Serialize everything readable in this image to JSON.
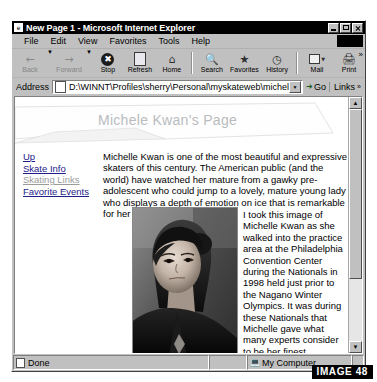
{
  "window": {
    "title": "New Page 1 - Microsoft Internet Explorer",
    "icon": "ie-document-icon",
    "controls": {
      "minimize": "Minimize",
      "maximize": "Maximize",
      "close": "Close"
    }
  },
  "menu": {
    "items": [
      {
        "label": "File"
      },
      {
        "label": "Edit"
      },
      {
        "label": "View"
      },
      {
        "label": "Favorites"
      },
      {
        "label": "Tools"
      },
      {
        "label": "Help"
      }
    ]
  },
  "toolbar": {
    "buttons": [
      {
        "label": "Back",
        "icon": "arrow-left-icon",
        "enabled": false
      },
      {
        "label": "Forward",
        "icon": "arrow-right-icon",
        "enabled": false
      },
      {
        "label": "Stop",
        "icon": "stop-icon",
        "enabled": true
      },
      {
        "label": "Refresh",
        "icon": "refresh-icon",
        "enabled": true
      },
      {
        "label": "Home",
        "icon": "home-icon",
        "enabled": true
      },
      {
        "label": "Search",
        "icon": "search-icon",
        "enabled": true
      },
      {
        "label": "Favorites",
        "icon": "favorites-star-icon",
        "enabled": true
      },
      {
        "label": "History",
        "icon": "history-clock-icon",
        "enabled": true
      },
      {
        "label": "Mail",
        "icon": "mail-icon",
        "enabled": true
      },
      {
        "label": "Print",
        "icon": "printer-icon",
        "enabled": true
      }
    ],
    "overflow": "»"
  },
  "address": {
    "label": "Address",
    "value": "D:\\WINNT\\Profiles\\sherry\\Personal\\myskateweb\\michelle.htm",
    "placeholder": "",
    "go_label": "Go",
    "links_label": "Links"
  },
  "page": {
    "heading": "Michele Kwan's Page",
    "nav_links": [
      {
        "label": "Up",
        "visited": false
      },
      {
        "label": "Skate Info",
        "visited": false
      },
      {
        "label": "Skating Links",
        "visited": true
      },
      {
        "label": "Favorite Events",
        "visited": false
      }
    ],
    "intro_paragraph": "Michelle Kwan is one of the most beautiful and expressive skaters of this century. The American public (and the world) have watched her mature from a gawky pre-adolescent who could jump to a lovely, mature young lady who displays a depth of emotion on ice that is remarkable for her years.",
    "side_paragraph": "I took this image of Michelle Kwan as she walked into the practice area at the Philadelphia Convention Center during the  Nationals in 1998 held just prior to the Nagano Winter Olympics. It was during these Nationals that Michelle gave what many experts consider to be her finest performance.",
    "photo_alt": "Black and white photograph of Michelle Kwan"
  },
  "status": {
    "left": "Done",
    "zone": "My Computer",
    "zone_icon": "computer-icon"
  },
  "caption": {
    "text": "IMAGE 48"
  },
  "colors": {
    "chrome": "#c0c0c0",
    "title_bar": "#000000",
    "link": "#1d1d8c",
    "visited_link": "#9b9b9b",
    "heading": "#b9bcc0",
    "caption_bg": "#000000",
    "caption_fg": "#ffffff"
  }
}
